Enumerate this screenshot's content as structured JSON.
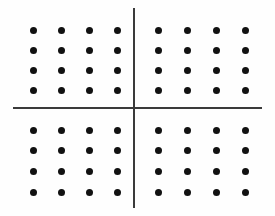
{
  "figure": {
    "width": 275,
    "height": 216,
    "background_color": "#fefefe"
  },
  "chart_data": {
    "type": "scatter",
    "title": "",
    "xlabel": "",
    "ylabel": "",
    "xlim": [
      0,
      275
    ],
    "ylim": [
      0,
      216
    ],
    "grid": false,
    "legend": null,
    "dot_color": "#111111",
    "dot_diameter": 7,
    "axis_color": "#3a3a3a",
    "axis_thickness": 2,
    "axes": [
      {
        "name": "vertical-axis",
        "orientation": "vertical",
        "position": 134,
        "start": 8,
        "end": 208
      },
      {
        "name": "horizontal-axis",
        "orientation": "horizontal",
        "position": 108,
        "start": 13,
        "end": 262
      }
    ],
    "origin": [
      134,
      108
    ],
    "quadrant_count": 4,
    "dots_per_quadrant": 16,
    "total_dots": 64,
    "rows_per_quadrant": 4,
    "columns_per_quadrant": 4,
    "column_spacing": 28,
    "row_spacing": 21,
    "quadrants": [
      {
        "name": "top-left",
        "label": "Quadrant II",
        "columns": [
          33,
          61,
          89,
          117
        ],
        "rows": [
          30,
          50,
          70,
          90
        ]
      },
      {
        "name": "top-right",
        "label": "Quadrant I",
        "columns": [
          158,
          187,
          216,
          245
        ],
        "rows": [
          30,
          50,
          70,
          90
        ]
      },
      {
        "name": "bottom-left",
        "label": "Quadrant III",
        "columns": [
          33,
          61,
          89,
          117
        ],
        "rows": [
          130,
          150,
          171,
          192
        ]
      },
      {
        "name": "bottom-right",
        "label": "Quadrant IV",
        "columns": [
          158,
          187,
          216,
          245
        ],
        "rows": [
          130,
          150,
          171,
          192
        ]
      }
    ]
  }
}
